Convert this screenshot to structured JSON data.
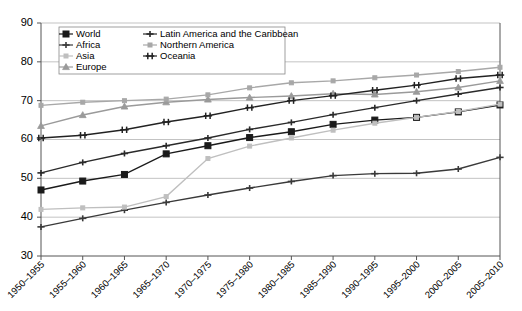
{
  "chart_data": {
    "type": "line",
    "title": "",
    "xlabel": "",
    "ylabel": "",
    "ylim": [
      30,
      90
    ],
    "ytick_step": 10,
    "yticks": [
      "30",
      "40",
      "50",
      "60",
      "70",
      "80",
      "90"
    ],
    "grid": true,
    "legend_position": "top-left-inside",
    "categories": [
      "1950–1955",
      "1955–1960",
      "1960–1965",
      "1965–1970",
      "1970–1975",
      "1975–1980",
      "1980–1985",
      "1985–1990",
      "1990–1995",
      "1995–2000",
      "2000–2005",
      "2005–2010"
    ],
    "series": [
      {
        "name": "World",
        "marker": "filled-square",
        "color": "#1a1a1a",
        "values": [
          47.0,
          49.3,
          51.0,
          56.3,
          58.4,
          60.5,
          62.0,
          63.9,
          65.0,
          65.7,
          67.1,
          68.9
        ]
      },
      {
        "name": "Africa",
        "marker": "plus",
        "color": "#3a3a3a",
        "values": [
          37.5,
          39.7,
          41.8,
          43.8,
          45.7,
          47.5,
          49.2,
          50.7,
          51.2,
          51.3,
          52.4,
          55.4
        ]
      },
      {
        "name": "Asia",
        "marker": "small-dot",
        "color": "#bfbfbf",
        "values": [
          42.0,
          42.4,
          42.6,
          45.3,
          55.1,
          58.3,
          60.4,
          62.4,
          64.2,
          65.7,
          67.2,
          69.1
        ]
      },
      {
        "name": "Europe",
        "marker": "triangle",
        "color": "#9a9a9a",
        "values": [
          63.5,
          66.3,
          68.5,
          69.6,
          70.3,
          70.8,
          71.2,
          71.8,
          71.6,
          72.3,
          73.4,
          75.1
        ]
      },
      {
        "name": "Latin America and the Caribbean",
        "marker": "plus-dark",
        "color": "#2a2a2a",
        "values": [
          51.4,
          54.1,
          56.4,
          58.4,
          60.4,
          62.6,
          64.4,
          66.4,
          68.2,
          70.0,
          71.7,
          73.4
        ]
      },
      {
        "name": "Northern America",
        "marker": "small-dot-gray",
        "color": "#a8a8a8",
        "values": [
          68.8,
          69.6,
          70.0,
          70.4,
          71.5,
          73.3,
          74.6,
          75.1,
          75.9,
          76.6,
          77.5,
          78.6
        ]
      },
      {
        "name": "Oceania",
        "marker": "double-bar",
        "color": "#222222",
        "values": [
          60.4,
          61.1,
          62.5,
          64.5,
          66.1,
          68.2,
          70.0,
          71.3,
          72.7,
          74.0,
          75.7,
          76.6
        ]
      }
    ],
    "legend": [
      {
        "label": "World",
        "marker": "filled-square"
      },
      {
        "label": "Latin America and the Caribbean",
        "marker": "plus-dark"
      },
      {
        "label": "Africa",
        "marker": "plus"
      },
      {
        "label": "Northern America",
        "marker": "small-dot-gray"
      },
      {
        "label": "Asia",
        "marker": "small-dot"
      },
      {
        "label": "Oceania",
        "marker": "double-bar"
      },
      {
        "label": "Europe",
        "marker": "triangle"
      }
    ]
  }
}
